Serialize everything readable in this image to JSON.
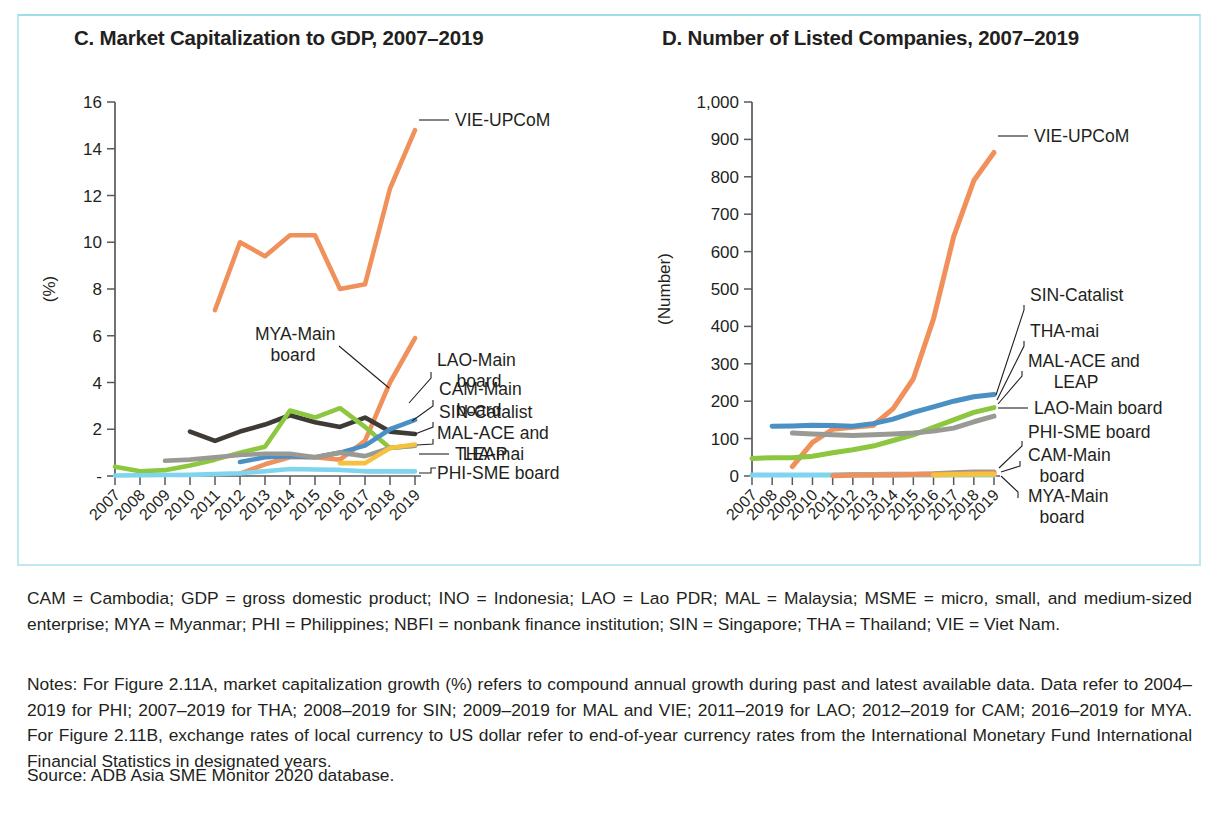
{
  "figure": {
    "border_color": "#bfe8ef",
    "background": "#ffffff"
  },
  "panels": {
    "c": {
      "title": "C. Market Capitalization to GDP, 2007–2019",
      "ylabel": "(%)"
    },
    "d": {
      "title": "D. Number of Listed Companies, 2007–2019",
      "ylabel": "(Number)"
    }
  },
  "footnotes": {
    "abbreviations": "CAM = Cambodia; GDP = gross domestic product; INO = Indonesia; LAO = Lao PDR; MAL = Malaysia; MSME = micro, small, and medium-sized enterprise; MYA = Myanmar; PHI = Philippines; NBFI = nonbank finance institution; SIN = Singapore; THA = Thailand; VIE = Viet Nam.",
    "notes": "Notes: For Figure 2.11A, market capitalization growth (%) refers to compound annual growth during past and latest available data. Data refer to 2004–2019 for PHI; 2007–2019 for THA; 2008–2019 for SIN; 2009–2019 for MAL and VIE; 2011–2019 for LAO; 2012–2019 for CAM; 2016–2019 for MYA. For Figure 2.11B, exchange rates of local currency to US dollar refer to end-of-year currency rates from the International Monetary Fund International Financial Statistics in designated years.",
    "source": "Source: ADB Asia SME Monitor 2020 database."
  },
  "chart_data": [
    {
      "id": "c",
      "type": "line",
      "title": "C. Market Capitalization to GDP, 2007–2019",
      "xlabel": "",
      "ylabel": "(%)",
      "ylim": [
        0,
        16
      ],
      "yticks": [
        0,
        2,
        4,
        6,
        8,
        10,
        12,
        14,
        16
      ],
      "ytick_labels": [
        "-",
        "2",
        "4",
        "6",
        "8",
        "10",
        "12",
        "14",
        "16"
      ],
      "grid": false,
      "legend": "right-callouts",
      "x": [
        "2007",
        "2008",
        "2009",
        "2010",
        "2011",
        "2012",
        "2013",
        "2014",
        "2015",
        "2016",
        "2017",
        "2018",
        "2019"
      ],
      "series": [
        {
          "name": "VIE-UPCoM",
          "color": "#F0905A",
          "values": [
            null,
            null,
            null,
            null,
            7.1,
            10.0,
            9.4,
            10.3,
            10.3,
            8.0,
            8.2,
            12.3,
            14.8
          ]
        },
        {
          "name": "CAM-Main board",
          "color": "#F0905A",
          "values": [
            null,
            null,
            null,
            null,
            null,
            0.1,
            0.5,
            0.8,
            0.8,
            0.7,
            1.5,
            4.0,
            5.9
          ]
        },
        {
          "name": "THA-mai",
          "color": "#3E3A36",
          "values": [
            null,
            null,
            null,
            1.9,
            1.5,
            1.9,
            2.2,
            2.6,
            2.3,
            2.1,
            2.5,
            1.9,
            1.8
          ]
        },
        {
          "name": "SIN-Catalist",
          "color": "#8DC63F",
          "values": [
            0.4,
            0.2,
            0.25,
            0.45,
            0.7,
            1.0,
            1.25,
            2.8,
            2.5,
            2.9,
            2.1,
            1.2,
            1.3
          ]
        },
        {
          "name": "MAL-ACE and LEAP",
          "color": "#4A90C4",
          "values": [
            null,
            null,
            null,
            null,
            null,
            0.6,
            0.8,
            0.85,
            0.8,
            1.0,
            1.3,
            2.0,
            2.4
          ]
        },
        {
          "name": "LAO-Main board",
          "color": "#9A9A95",
          "values": [
            null,
            null,
            0.65,
            0.7,
            0.8,
            0.9,
            0.95,
            0.95,
            0.8,
            1.0,
            0.85,
            1.2,
            1.3
          ]
        },
        {
          "name": "MYA-Main board",
          "color": "#F5C13E",
          "values": [
            null,
            null,
            null,
            null,
            null,
            null,
            null,
            null,
            null,
            0.55,
            0.55,
            1.2,
            1.35
          ]
        },
        {
          "name": "PHI-SME board",
          "color": "#7FD4EE",
          "values": [
            0.02,
            0.03,
            0.04,
            0.05,
            0.08,
            0.12,
            0.2,
            0.3,
            0.28,
            0.26,
            0.2,
            0.2,
            0.2
          ]
        }
      ]
    },
    {
      "id": "d",
      "type": "line",
      "title": "D. Number of Listed Companies, 2007–2019",
      "xlabel": "",
      "ylabel": "(Number)",
      "ylim": [
        0,
        1000
      ],
      "yticks": [
        0,
        100,
        200,
        300,
        400,
        500,
        600,
        700,
        800,
        900,
        1000
      ],
      "ytick_labels": [
        "0",
        "100",
        "200",
        "300",
        "400",
        "500",
        "600",
        "700",
        "800",
        "900",
        "1,000"
      ],
      "grid": false,
      "legend": "right-callouts",
      "x": [
        "2007",
        "2008",
        "2009",
        "2010",
        "2011",
        "2012",
        "2013",
        "2014",
        "2015",
        "2016",
        "2017",
        "2018",
        "2019"
      ],
      "series": [
        {
          "name": "VIE-UPCoM",
          "color": "#F0905A",
          "values": [
            null,
            null,
            25,
            90,
            125,
            130,
            135,
            180,
            260,
            420,
            640,
            790,
            865
          ]
        },
        {
          "name": "SIN-Catalist",
          "color": "#4A90C4",
          "values": [
            null,
            133,
            134,
            136,
            135,
            133,
            140,
            152,
            170,
            185,
            200,
            212,
            218
          ]
        },
        {
          "name": "THA-mai",
          "color": "#8DC63F",
          "values": [
            47,
            49,
            49,
            53,
            62,
            70,
            80,
            95,
            110,
            130,
            150,
            170,
            183
          ]
        },
        {
          "name": "MAL-ACE and LEAP",
          "color": "#9A9A95",
          "values": [
            null,
            null,
            115,
            112,
            110,
            108,
            110,
            112,
            115,
            120,
            128,
            145,
            160
          ]
        },
        {
          "name": "LAO-Main board",
          "color": "#9A9A95",
          "values": [
            null,
            null,
            null,
            null,
            2,
            4,
            4,
            5,
            5,
            6,
            9,
            11,
            11
          ]
        },
        {
          "name": "PHI-SME board",
          "color": "#7FD4EE",
          "values": [
            3,
            3,
            3,
            3,
            3,
            3,
            3,
            3,
            3,
            3,
            3,
            3,
            3
          ]
        },
        {
          "name": "CAM-Main board",
          "color": "#F0905A",
          "values": [
            null,
            null,
            null,
            null,
            1,
            2,
            3,
            3,
            4,
            5,
            5,
            6,
            8
          ]
        },
        {
          "name": "MYA-Main board",
          "color": "#F5C13E",
          "values": [
            null,
            null,
            null,
            null,
            null,
            null,
            null,
            null,
            null,
            3,
            4,
            5,
            5
          ]
        }
      ]
    }
  ],
  "callouts": {
    "c": [
      {
        "label": "VIE-UPCoM"
      },
      {
        "label": "LAO-Main",
        "label2": "board"
      },
      {
        "label": "CAM-Main",
        "label2": "board"
      },
      {
        "label": "SIN-Catalist"
      },
      {
        "label": "MAL-ACE and",
        "label2": "LEAP"
      },
      {
        "label": "THA-mai"
      },
      {
        "label": "PHI-SME board"
      },
      {
        "label": "MYA-Main",
        "label2": "board"
      }
    ],
    "d": [
      {
        "label": "VIE-UPCoM"
      },
      {
        "label": "SIN-Catalist"
      },
      {
        "label": "THA-mai"
      },
      {
        "label": "MAL-ACE and",
        "label2": "LEAP"
      },
      {
        "label": "LAO-Main board"
      },
      {
        "label": "PHI-SME board"
      },
      {
        "label": "CAM-Main",
        "label2": "board"
      },
      {
        "label": "MYA-Main",
        "label2": "board"
      }
    ]
  }
}
